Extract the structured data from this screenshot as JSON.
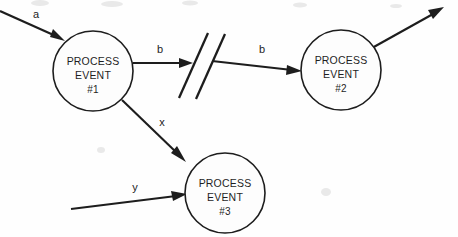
{
  "diagram": {
    "type": "data-flow-diagram",
    "background_color": "#fefefe",
    "line_color": "#1d1d1d",
    "text_color": "#1f1f1f"
  },
  "nodes": [
    {
      "id": "process-event-1",
      "line1": "PROCESS",
      "line2": "EVENT",
      "line3": "#1",
      "cx": 93,
      "cy": 71,
      "r": 40
    },
    {
      "id": "process-event-2",
      "line1": "PROCESS",
      "line2": "EVENT",
      "line3": "#2",
      "cx": 341,
      "cy": 70,
      "r": 40
    },
    {
      "id": "process-event-3",
      "line1": "PROCESS",
      "line2": "EVENT",
      "line3": "#3",
      "cx": 225,
      "cy": 193,
      "r": 40
    }
  ],
  "flows": [
    {
      "id": "flow-a",
      "label": "a",
      "label_x": 36,
      "label_y": 14,
      "from": "external-left",
      "to": "process-event-1"
    },
    {
      "id": "flow-b-left",
      "label": "b",
      "label_x": 160,
      "label_y": 49,
      "from": "process-event-1",
      "to": "break-symbol"
    },
    {
      "id": "flow-b-right",
      "label": "b",
      "label_x": 262,
      "label_y": 49,
      "from": "break-symbol",
      "to": "process-event-2"
    },
    {
      "id": "flow-x",
      "label": "x",
      "label_x": 162,
      "label_y": 122,
      "from": "process-event-1",
      "to": "process-event-3"
    },
    {
      "id": "flow-y",
      "label": "y",
      "label_x": 135,
      "label_y": 187,
      "from": "external-bottom-left",
      "to": "process-event-3"
    },
    {
      "id": "flow-out",
      "label": "",
      "from": "process-event-2",
      "to": "external-top-right"
    }
  ],
  "break_symbol": {
    "id": "break-symbol",
    "name": "double-slash-break",
    "slash_count": 2
  }
}
